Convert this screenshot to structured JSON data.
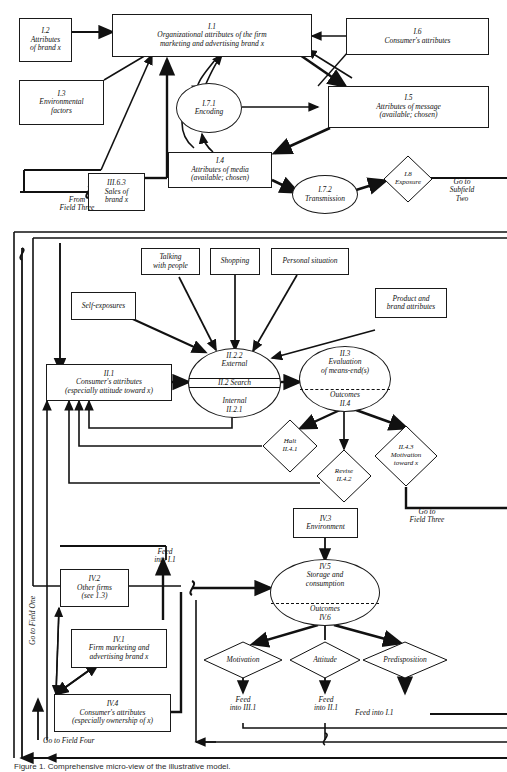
{
  "figure": {
    "caption": "Figure 1.   Comprehensive micro-view of the illustrative model.",
    "ink_color": "#111111",
    "paper_color": "#ffffff"
  },
  "field_one": {
    "nodes": [
      {
        "id": "I.2",
        "label": "I.2\nAttributes\nof brand x",
        "shape": "box"
      },
      {
        "id": "I.3",
        "label": "I.3\nEnvironmental\nfactors",
        "shape": "box"
      },
      {
        "id": "I.1",
        "label": "I.1\nOrganizational attributes of the firm\nmarketing and advertising brand x",
        "shape": "box"
      },
      {
        "id": "I.6",
        "label": "I.6\nConsumer's attributes",
        "shape": "box"
      },
      {
        "id": "I.5",
        "label": "I.5\nAttributes of message\n(available; chosen)",
        "shape": "box"
      },
      {
        "id": "I.7.1",
        "label": "I.7.1\nEncoding",
        "shape": "ellipse"
      },
      {
        "id": "I.4",
        "label": "I.4\nAttributes of media\n(available; chosen)",
        "shape": "box"
      },
      {
        "id": "I.7.2",
        "label": "I.7.2\nTransmission",
        "shape": "ellipse"
      },
      {
        "id": "I.8",
        "label": "I.8\nExposure",
        "shape": "diamond"
      },
      {
        "id": "III.6.3",
        "label": "III.6.3\nSales of\nbrand x",
        "shape": "box"
      }
    ],
    "connectors": [
      {
        "label": "From\nField Three"
      },
      {
        "label": "Go to\nSubfield\nTwo"
      }
    ]
  },
  "field_two": {
    "nodes": [
      {
        "id": "talking",
        "label": "Talking\nwith people",
        "shape": "box"
      },
      {
        "id": "shopping",
        "label": "Shopping",
        "shape": "box"
      },
      {
        "id": "personal",
        "label": "Personal situation",
        "shape": "box"
      },
      {
        "id": "self",
        "label": "Self-exposures",
        "shape": "box"
      },
      {
        "id": "product",
        "label": "Product and\nbrand attributes",
        "shape": "box"
      },
      {
        "id": "II.1",
        "label": "II.1\nConsumer's attributes\n(especially attitude toward x)",
        "shape": "box"
      },
      {
        "id": "II.2",
        "label": "II.2.2\nExternal",
        "shape": "ellipse-split",
        "middle": "II.2 Search",
        "bottom": "Internal\nII.2.1"
      },
      {
        "id": "II.3",
        "label": "II.3\nEvaluation\nof means-end(s)",
        "shape": "ellipse-split",
        "bottom": "Outcomes\nII.4"
      },
      {
        "id": "II.4.1",
        "label": "Halt\nII.4.1",
        "shape": "diamond"
      },
      {
        "id": "II.4.2",
        "label": "Revise\nII.4.2",
        "shape": "diamond"
      },
      {
        "id": "II.4.3",
        "label": "II.4.3\nMotivation\ntoward x",
        "shape": "diamond"
      }
    ],
    "connectors": [
      {
        "label": "Go to\nField Three"
      }
    ]
  },
  "field_four": {
    "nodes": [
      {
        "id": "IV.3",
        "label": "IV.3\nEnvironment",
        "shape": "box"
      },
      {
        "id": "IV.2",
        "label": "IV.2\nOther firms\n(see 1.3)",
        "shape": "box"
      },
      {
        "id": "IV.1",
        "label": "IV.1\nFirm marketing and\nadvertising brand x",
        "shape": "box"
      },
      {
        "id": "IV.4",
        "label": "IV.4\nConsumer's attributes\n(especially ownership of x)",
        "shape": "box"
      },
      {
        "id": "IV.5",
        "label": "IV.5\nStorage and\nconsumption",
        "shape": "ellipse-split",
        "bottom": "Outcomes\nIV.6"
      },
      {
        "id": "motivation",
        "label": "Motivation",
        "shape": "diamond"
      },
      {
        "id": "attitude",
        "label": "Attitude",
        "shape": "diamond"
      },
      {
        "id": "predisposition",
        "label": "Predisposition",
        "shape": "diamond"
      }
    ],
    "connectors": [
      {
        "label": "Feed\ninto I.1"
      },
      {
        "label": "Feed\ninto III.1"
      },
      {
        "label": "Feed\ninto II.1"
      },
      {
        "label": "Feed into I.1"
      },
      {
        "label": "Go to Field One"
      },
      {
        "label": "Go to Field Four"
      }
    ]
  }
}
